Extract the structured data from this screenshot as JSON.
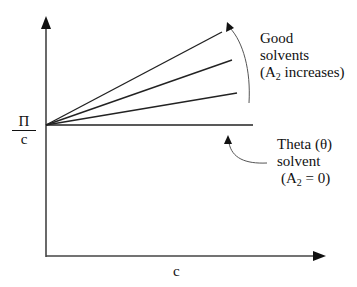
{
  "diagram": {
    "y_axis_label": {
      "numerator": "Π",
      "denominator": "c"
    },
    "x_axis_label": "c",
    "annotations": {
      "good_solvents": {
        "line1": "Good",
        "line2": "solvents",
        "line3_prefix": "(A",
        "line3_sub": "2",
        "line3_suffix": " increases)"
      },
      "theta_solvent": {
        "line1": "Theta (θ)",
        "line2": "solvent",
        "line3_prefix": "(A",
        "line3_sub": "2",
        "line3_suffix": " = 0)"
      }
    },
    "lines": [
      {
        "name": "good-solvent-line-high",
        "slope": "steepest"
      },
      {
        "name": "good-solvent-line-mid",
        "slope": "medium"
      },
      {
        "name": "good-solvent-line-low",
        "slope": "shallow"
      },
      {
        "name": "theta-solvent-line",
        "slope": "zero"
      }
    ],
    "colors": {
      "line": "#222222",
      "arrow": "#555555",
      "background": "#ffffff"
    }
  }
}
